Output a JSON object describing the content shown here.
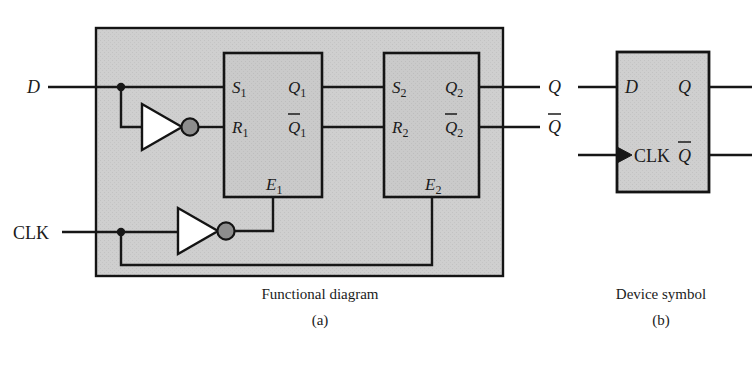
{
  "figure": {
    "kind": "logic-circuit-diagram",
    "colors": {
      "background": "#ffffff",
      "block_fill": "#cfcfcf",
      "inner_block_fill": "#cacaca",
      "wire": "#171717",
      "outline": "#141414",
      "bubble_fill": "#8d8d8d",
      "text": "#1b1b1b"
    }
  },
  "panel_a": {
    "caption_title": "Functional diagram",
    "caption_letter": "(a)",
    "external_inputs": [
      {
        "name": "D",
        "label": "D"
      },
      {
        "name": "CLK",
        "label": "CLK"
      }
    ],
    "external_outputs": [
      {
        "name": "Q",
        "label": "Q"
      },
      {
        "name": "Qbar",
        "label": "Q̅"
      }
    ],
    "latch1": {
      "name": "master-latch",
      "inputs": [
        {
          "label": "S",
          "sub": "1"
        },
        {
          "label": "R",
          "sub": "1"
        }
      ],
      "enable": {
        "label": "E",
        "sub": "1"
      },
      "outputs": [
        {
          "label": "Q",
          "sub": "1",
          "bar": false
        },
        {
          "label": "Q",
          "sub": "1",
          "bar": true
        }
      ]
    },
    "latch2": {
      "name": "slave-latch",
      "inputs": [
        {
          "label": "S",
          "sub": "2"
        },
        {
          "label": "R",
          "sub": "2"
        }
      ],
      "enable": {
        "label": "E",
        "sub": "2"
      },
      "outputs": [
        {
          "label": "Q",
          "sub": "2",
          "bar": false
        },
        {
          "label": "Q",
          "sub": "2",
          "bar": true
        }
      ]
    },
    "inverters": [
      {
        "name": "d-inverter",
        "input_from": "D",
        "output_to": "R1"
      },
      {
        "name": "clk-inverter",
        "input_from": "CLK",
        "output_to": "E1"
      }
    ],
    "junctions": [
      {
        "name": "d-node"
      },
      {
        "name": "clk-node"
      }
    ]
  },
  "panel_b": {
    "caption_title": "Device symbol",
    "caption_letter": "(b)",
    "pins_left": [
      {
        "name": "D",
        "label": "D",
        "edge_triggered": false
      },
      {
        "name": "CLK",
        "label": "CLK",
        "edge_triggered": true
      }
    ],
    "pins_right": [
      {
        "name": "Q",
        "label": "Q",
        "bar": false
      },
      {
        "name": "Qbar",
        "label": "Q̅",
        "bar": true
      }
    ]
  }
}
